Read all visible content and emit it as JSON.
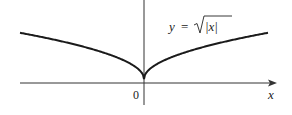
{
  "chart_data": {
    "type": "line",
    "title": "",
    "equation_label": "y = √|x|",
    "equation_parts": {
      "lhs": "y",
      "eq": "=",
      "radicand": "|x|"
    },
    "xlabel": "x",
    "ylabel": "",
    "origin_label": "0",
    "function": "sqrt(abs(x))",
    "series": [
      {
        "name": "y = sqrt(|x|)",
        "x": [
          -1,
          -0.75,
          -0.5,
          -0.25,
          -0.1,
          0,
          0.1,
          0.25,
          0.5,
          0.75,
          1
        ],
        "values": [
          1,
          0.866,
          0.707,
          0.5,
          0.316,
          0,
          0.316,
          0.5,
          0.707,
          0.866,
          1
        ]
      }
    ],
    "grid": false,
    "legend": null,
    "axes": {
      "x_arrow": true,
      "y_arrow": false
    }
  },
  "colors": {
    "curve": "#1a1a1a",
    "axis": "#333333",
    "background": "#ffffff"
  }
}
